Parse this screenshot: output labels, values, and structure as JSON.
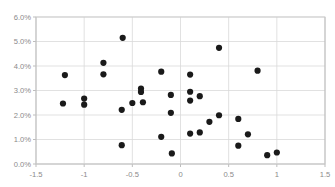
{
  "chart_data": {
    "type": "scatter",
    "title": "",
    "subtitle": "",
    "xlabel": "",
    "ylabel": "",
    "xlim": [
      -1.5,
      1.5
    ],
    "ylim": [
      0.0,
      0.06
    ],
    "x_ticks": [
      -1.5,
      -1,
      -0.5,
      0,
      0.5,
      1,
      1.5
    ],
    "x_tick_labels": [
      "-1.5",
      "-1",
      "-0.5",
      "0",
      "0.5",
      "1",
      "1.5"
    ],
    "y_ticks": [
      0.0,
      0.01,
      0.02,
      0.03,
      0.04,
      0.05,
      0.06
    ],
    "y_tick_labels": [
      "0.0%",
      "1.0%",
      "2.0%",
      "3.0%",
      "4.0%",
      "5.0%",
      "6.0%"
    ],
    "grid": true,
    "grid_axis": "both",
    "legend": false,
    "legend_position": "none",
    "marker": {
      "shape": "circle",
      "color": "#1a1a1a",
      "size_px": 3.1
    },
    "series": [
      {
        "name": "series-1",
        "color": "#1a1a1a",
        "points": [
          {
            "x": -1.2,
            "y": 0.0363
          },
          {
            "x": -1.22,
            "y": 0.0247
          },
          {
            "x": -1.0,
            "y": 0.0267
          },
          {
            "x": -1.0,
            "y": 0.0242
          },
          {
            "x": -0.8,
            "y": 0.0413
          },
          {
            "x": -0.8,
            "y": 0.0366
          },
          {
            "x": -0.6,
            "y": 0.0515
          },
          {
            "x": -0.61,
            "y": 0.0221
          },
          {
            "x": -0.61,
            "y": 0.0077
          },
          {
            "x": -0.5,
            "y": 0.0249
          },
          {
            "x": -0.41,
            "y": 0.0308
          },
          {
            "x": -0.41,
            "y": 0.0294
          },
          {
            "x": -0.39,
            "y": 0.0252
          },
          {
            "x": -0.2,
            "y": 0.0377
          },
          {
            "x": -0.2,
            "y": 0.0111
          },
          {
            "x": -0.1,
            "y": 0.0282
          },
          {
            "x": -0.1,
            "y": 0.0209
          },
          {
            "x": -0.09,
            "y": 0.0043
          },
          {
            "x": 0.1,
            "y": 0.0365
          },
          {
            "x": 0.1,
            "y": 0.0295
          },
          {
            "x": 0.1,
            "y": 0.0259
          },
          {
            "x": 0.1,
            "y": 0.0124
          },
          {
            "x": 0.2,
            "y": 0.0277
          },
          {
            "x": 0.2,
            "y": 0.0129
          },
          {
            "x": 0.3,
            "y": 0.0172
          },
          {
            "x": 0.4,
            "y": 0.0474
          },
          {
            "x": 0.4,
            "y": 0.0199
          },
          {
            "x": 0.6,
            "y": 0.0184
          },
          {
            "x": 0.6,
            "y": 0.0075
          },
          {
            "x": 0.7,
            "y": 0.0121
          },
          {
            "x": 0.8,
            "y": 0.0381
          },
          {
            "x": 0.9,
            "y": 0.0036
          },
          {
            "x": 1.0,
            "y": 0.0047
          }
        ]
      }
    ]
  },
  "axes": {
    "y_labels": [
      "6.0%",
      "5.0%",
      "4.0%",
      "3.0%",
      "2.0%",
      "1.0%",
      "0.0%"
    ],
    "x_labels": [
      "-1.5",
      "-1",
      "-0.5",
      "0",
      "0.5",
      "1",
      "1.5"
    ]
  },
  "colors": {
    "marker": "#1a1a1a",
    "grid": "#d9d9d9",
    "axis": "#b5b5b5",
    "tick_text": "#8a8a8a",
    "background": "#ffffff"
  }
}
